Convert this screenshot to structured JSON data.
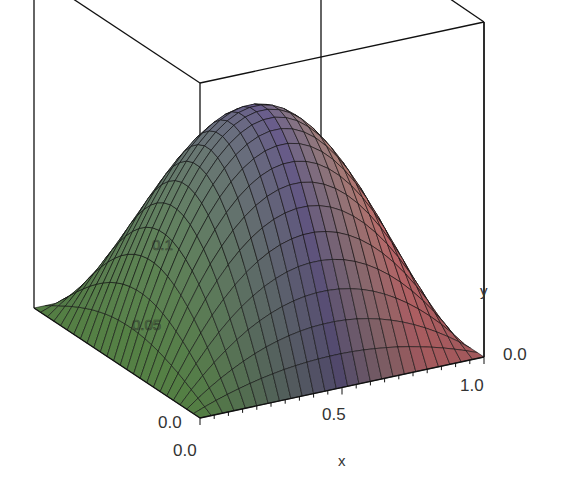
{
  "chart_data": {
    "type": "surface3d",
    "title": "",
    "function": "z = x*(1-x)*sin(pi*y)/2.5",
    "x": {
      "label": "x",
      "range": [
        0.0,
        1.0
      ],
      "ticks": [
        "0.0",
        "0.5",
        "1.0"
      ],
      "grid_points": 25
    },
    "y": {
      "label": "y",
      "range": [
        0.0,
        1.0
      ],
      "ticks": [
        "0.0",
        "0.0"
      ],
      "grid_points": 25
    },
    "z": {
      "label": "",
      "range": [
        0.0,
        0.1
      ],
      "ticks": [
        "0.05",
        "0.1"
      ]
    },
    "peak": {
      "x": 0.5,
      "y": 0.5,
      "z": 0.1
    },
    "boundary_value": 0.0,
    "shading": "xy-gradient",
    "colors": {
      "left": "#6faa58",
      "center": "#6a5e8c",
      "right_light": "#d6dc6a",
      "right": "#d8767a",
      "edge": "#111111",
      "box": "#111111"
    },
    "labels": {
      "x_tick_0": "0.0",
      "x_tick_mid": "0.5",
      "x_tick_1": "1.0",
      "y_tick_front": "0.0",
      "y_tick_right": "0.0",
      "x_title": "x",
      "y_title": "y",
      "z_tick_low": "0.05",
      "z_tick_high": "0.1"
    }
  }
}
